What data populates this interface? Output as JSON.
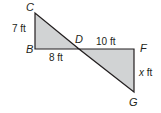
{
  "diagram": {
    "points": {
      "C": {
        "label": "C",
        "x": 35,
        "y": 13
      },
      "B": {
        "label": "B",
        "x": 35,
        "y": 49
      },
      "D": {
        "label": "D",
        "x": 79,
        "y": 49
      },
      "F": {
        "label": "F",
        "x": 134,
        "y": 49
      },
      "G": {
        "label": "G",
        "x": 134,
        "y": 92
      }
    },
    "measurements": {
      "CB": "7 ft",
      "BD": "8 ft",
      "DF": "10 ft",
      "FG_prefix": "x",
      "FG_unit": " ft"
    },
    "colors": {
      "fill": "#d1d3d4",
      "stroke": "#231f20"
    }
  }
}
